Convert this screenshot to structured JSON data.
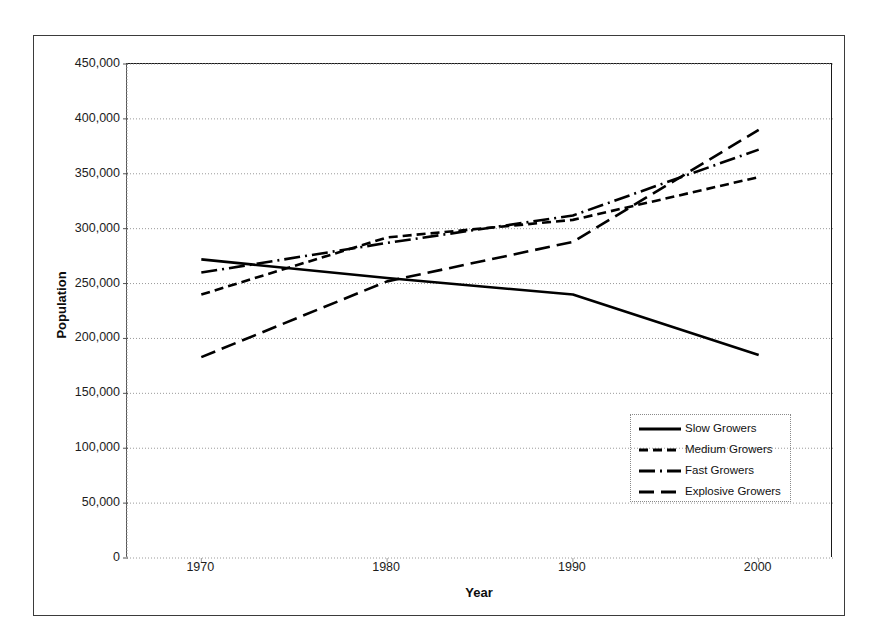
{
  "chart_data": {
    "type": "line",
    "title": "",
    "xlabel": "Year",
    "ylabel": "Population",
    "x": [
      1970,
      1980,
      1990,
      2000
    ],
    "xtick_labels": [
      "1970",
      "1980",
      "1990",
      "2000"
    ],
    "ytick_labels": [
      "0",
      "50,000",
      "100,000",
      "150,000",
      "200,000",
      "250,000",
      "300,000",
      "350,000",
      "400,000",
      "450,000"
    ],
    "ytick_values": [
      0,
      50000,
      100000,
      150000,
      200000,
      250000,
      300000,
      350000,
      400000,
      450000
    ],
    "xlim": [
      1966,
      2004
    ],
    "ylim": [
      0,
      450000
    ],
    "grid": "horizontal-dotted",
    "legend_position": "inside-lower-right",
    "series": [
      {
        "name": "Slow Growers",
        "style": "solid",
        "color": "#000000",
        "values": [
          272000,
          255000,
          240000,
          185000
        ]
      },
      {
        "name": "Medium Growers",
        "style": "dashed",
        "color": "#000000",
        "values": [
          240000,
          292000,
          308000,
          347000
        ]
      },
      {
        "name": "Fast Growers",
        "style": "dash-dot",
        "color": "#000000",
        "values": [
          260000,
          287000,
          312000,
          372000
        ]
      },
      {
        "name": "Explosive Growers",
        "style": "long-dash",
        "color": "#000000",
        "values": [
          183000,
          252000,
          288000,
          390000
        ]
      }
    ]
  },
  "legend": {
    "entries": [
      {
        "label": "Slow Growers",
        "style": "solid"
      },
      {
        "label": "Medium Growers",
        "style": "dashed"
      },
      {
        "label": "Fast Growers",
        "style": "dash-dot"
      },
      {
        "label": "Explosive Growers",
        "style": "long-dash"
      }
    ]
  },
  "axes": {
    "x_title": "Year",
    "y_title": "Population"
  }
}
